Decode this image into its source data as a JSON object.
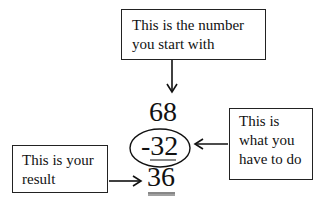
{
  "boxes": {
    "start": "This is the number\nyou start with",
    "operation": "This is\nwhat you\nhave to do",
    "result": "This is your\nresult"
  },
  "numbers": {
    "start": "68",
    "operation": "-32",
    "result": "36"
  },
  "colors": {
    "ink": "#111111",
    "background": "#ffffff"
  }
}
